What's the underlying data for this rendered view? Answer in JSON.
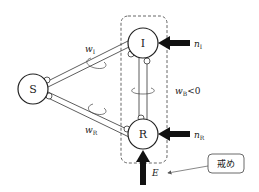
{
  "diagram": {
    "nodes": {
      "S": {
        "label": "S"
      },
      "I": {
        "label": "I"
      },
      "R": {
        "label": "R"
      }
    },
    "couplings": {
      "w_I": {
        "base": "w",
        "sub": "I"
      },
      "w_R": {
        "base": "w",
        "sub": "R"
      },
      "w_B": {
        "base": "w",
        "sub": "B",
        "suffix": "<0"
      }
    },
    "inputs": {
      "n_I": {
        "base": "n",
        "sub": "I"
      },
      "n_R": {
        "base": "n",
        "sub": "R"
      },
      "E": {
        "label": "E"
      }
    },
    "callout": {
      "label": "戒め"
    },
    "colors": {
      "stroke": "#222222",
      "dashed": "#555555",
      "background": "#ffffff"
    }
  }
}
